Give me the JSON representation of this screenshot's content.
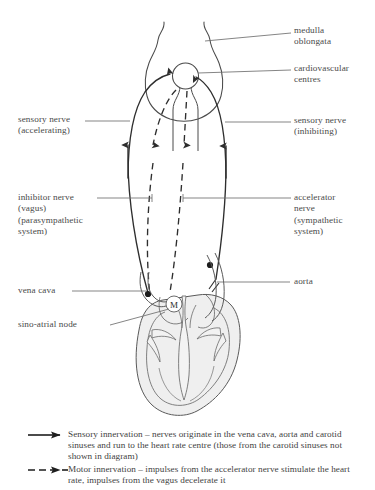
{
  "diagram": {
    "background_color": "#ffffff",
    "ink_color": "#3a3a3a",
    "heart_fill_color": "#efefef"
  },
  "labels": {
    "medulla_oblongata": "medulla\noblongata",
    "cardiovascular_centres": "cardiovascular\ncentres",
    "sensory_nerve_accelerating": "sensory nerve\n(accelerating)",
    "sensory_nerve_inhibiting": "sensory nerve\n(inhibiting)",
    "inhibitor_nerve_vagus": "inhibitor nerve\n(vagus)\n(parasympathetic\nsystem)",
    "accelerator_nerve_sympathetic": "accelerator\nnerve\n(sympathetic\nsystem)",
    "vena_cava": "vena cava",
    "aorta": "aorta",
    "sino_atrial_node": "sino-atrial node",
    "sa_node_glyph": "M"
  },
  "legend": {
    "entries": [
      {
        "symbol": "solid-arrow",
        "text": "Sensory innervation – nerves originate in the vena cava, aorta and carotid sinuses and run to the heart rate centre (those from the carotid sinuses not shown in diagram)"
      },
      {
        "symbol": "dashed-arrow",
        "text": "Motor innervation – impulses from the accelerator nerve stimulate the heart rate, impulses from the vagus decelerate it"
      }
    ]
  }
}
